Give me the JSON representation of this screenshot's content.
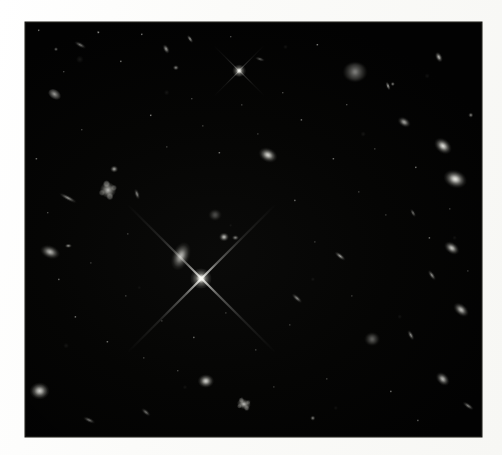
{
  "page": {
    "background_color": "#fdfdfc",
    "width": 502,
    "height": 455
  },
  "image": {
    "alt_text": "Deep field astronomical image of distant galaxies",
    "frame": {
      "x": 25,
      "y": 22,
      "width": 457,
      "height": 415
    },
    "background_color": "#010101",
    "object_color": "#fffff5",
    "caption": ""
  },
  "chart_data": {
    "type": "scatter",
    "title": "",
    "xlabel": "",
    "ylabel": "",
    "note": "Positions are percentages within the image frame; size in frame-relative percent; brightness 0-1.",
    "objects": [
      {
        "name": "faint-streak-galaxy",
        "shape": "edge-on",
        "x": 12.0,
        "y": 5.5,
        "w": 3.0,
        "h": 1.3,
        "rot": 28,
        "bright": 0.52
      },
      {
        "name": "compact-knot",
        "shape": "round",
        "x": 6.8,
        "y": 6.5,
        "w": 1.1,
        "h": 1.1,
        "rot": 0,
        "bright": 0.45
      },
      {
        "name": "elongated-galaxy-top",
        "shape": "elliptical",
        "x": 30.8,
        "y": 6.6,
        "w": 2.4,
        "h": 1.5,
        "rot": 62,
        "bright": 0.62
      },
      {
        "name": "bright-spindle-upper",
        "shape": "edge-on",
        "x": 36.0,
        "y": 4.0,
        "w": 2.2,
        "h": 1.0,
        "rot": 55,
        "bright": 0.66
      },
      {
        "name": "diffuse-galaxy-upper",
        "shape": "round",
        "x": 33.0,
        "y": 11.0,
        "w": 1.6,
        "h": 1.6,
        "rot": 0,
        "bright": 0.5
      },
      {
        "name": "foreground-star-upper",
        "shape": "star",
        "x": 46.8,
        "y": 11.8,
        "w": 3.0,
        "h": 3.0,
        "rot": 0,
        "bright": 0.95
      },
      {
        "name": "small-spindle-a",
        "shape": "edge-on",
        "x": 51.5,
        "y": 9.0,
        "w": 2.4,
        "h": 0.9,
        "rot": 18,
        "bright": 0.4
      },
      {
        "name": "fuzzy-irregular-top",
        "shape": "fuzzy",
        "x": 72.2,
        "y": 12.0,
        "w": 5.0,
        "h": 4.4,
        "rot": 0,
        "bright": 0.7
      },
      {
        "name": "bright-spindle-top-right",
        "shape": "elliptical",
        "x": 90.5,
        "y": 8.5,
        "w": 2.6,
        "h": 1.6,
        "rot": 65,
        "bright": 0.82
      },
      {
        "name": "corner-knot-right",
        "shape": "round",
        "x": 80.5,
        "y": 15.0,
        "w": 1.2,
        "h": 1.2,
        "rot": 0,
        "bright": 0.48
      },
      {
        "name": "spindle-right-upper",
        "shape": "edge-on",
        "x": 79.5,
        "y": 15.5,
        "w": 2.2,
        "h": 1.0,
        "rot": 70,
        "bright": 0.72
      },
      {
        "name": "elliptical-right-a",
        "shape": "elliptical",
        "x": 83.0,
        "y": 24.0,
        "w": 3.2,
        "h": 2.4,
        "rot": 30,
        "bright": 0.66
      },
      {
        "name": "bright-galaxy-right-a",
        "shape": "elliptical",
        "x": 91.5,
        "y": 29.8,
        "w": 4.6,
        "h": 3.6,
        "rot": 40,
        "bright": 0.88
      },
      {
        "name": "bright-galaxy-right-b",
        "shape": "round",
        "x": 94.0,
        "y": 37.8,
        "w": 5.6,
        "h": 4.6,
        "rot": 20,
        "bright": 0.92
      },
      {
        "name": "knot-right-edge",
        "shape": "round",
        "x": 97.5,
        "y": 22.5,
        "w": 1.4,
        "h": 1.4,
        "rot": 0,
        "bright": 0.52
      },
      {
        "name": "galaxy-left-upper",
        "shape": "irregular",
        "x": 6.5,
        "y": 17.5,
        "w": 3.2,
        "h": 2.6,
        "rot": 35,
        "bright": 0.64
      },
      {
        "name": "elliptical-center-upper",
        "shape": "elliptical",
        "x": 53.2,
        "y": 32.0,
        "w": 4.6,
        "h": 3.6,
        "rot": 25,
        "bright": 0.85
      },
      {
        "name": "spiral-galaxy-left",
        "shape": "spiral",
        "x": 18.2,
        "y": 40.5,
        "w": 4.8,
        "h": 6.0,
        "rot": 25,
        "bright": 0.72
      },
      {
        "name": "knot-above-spiral",
        "shape": "round",
        "x": 19.5,
        "y": 35.5,
        "w": 1.9,
        "h": 1.9,
        "rot": 0,
        "bright": 0.62
      },
      {
        "name": "edge-on-left-lower",
        "shape": "edge-on",
        "x": 9.5,
        "y": 42.5,
        "w": 4.6,
        "h": 1.2,
        "rot": 28,
        "bright": 0.58
      },
      {
        "name": "spindle-right-of-spiral",
        "shape": "edge-on",
        "x": 24.5,
        "y": 41.5,
        "w": 2.6,
        "h": 1.2,
        "rot": 72,
        "bright": 0.55
      },
      {
        "name": "fuzzy-blob-center",
        "shape": "fuzzy",
        "x": 41.5,
        "y": 46.5,
        "w": 2.6,
        "h": 2.2,
        "rot": 0,
        "bright": 0.48
      },
      {
        "name": "compact-round-center",
        "shape": "round",
        "x": 43.5,
        "y": 51.8,
        "w": 2.4,
        "h": 2.4,
        "rot": 0,
        "bright": 0.74
      },
      {
        "name": "elongated-galaxy-center",
        "shape": "elliptical",
        "x": 34.2,
        "y": 56.5,
        "w": 4.2,
        "h": 7.6,
        "rot": 22,
        "bright": 0.74
      },
      {
        "name": "bright-star-center",
        "shape": "star",
        "x": 38.6,
        "y": 61.8,
        "w": 4.6,
        "h": 4.6,
        "rot": 0,
        "bright": 1.0
      },
      {
        "name": "galaxy-left-center",
        "shape": "elliptical",
        "x": 5.5,
        "y": 55.5,
        "w": 4.8,
        "h": 3.4,
        "rot": 20,
        "bright": 0.72
      },
      {
        "name": "companion-knot-left",
        "shape": "round",
        "x": 9.5,
        "y": 54.0,
        "w": 1.6,
        "h": 1.3,
        "rot": 0,
        "bright": 0.54
      },
      {
        "name": "knot-above-star",
        "shape": "round",
        "x": 46.0,
        "y": 52.0,
        "w": 1.6,
        "h": 1.6,
        "rot": 0,
        "bright": 0.5
      },
      {
        "name": "spindle-mid-right",
        "shape": "edge-on",
        "x": 69.0,
        "y": 56.5,
        "w": 3.0,
        "h": 1.2,
        "rot": 38,
        "bright": 0.66
      },
      {
        "name": "spindle-far-right",
        "shape": "edge-on",
        "x": 85.0,
        "y": 46.0,
        "w": 2.2,
        "h": 1.0,
        "rot": 60,
        "bright": 0.5
      },
      {
        "name": "elliptical-right-mid",
        "shape": "elliptical",
        "x": 93.5,
        "y": 54.5,
        "w": 4.0,
        "h": 2.8,
        "rot": 35,
        "bright": 0.8
      },
      {
        "name": "spindle-right-mid-b",
        "shape": "edge-on",
        "x": 89.0,
        "y": 61.0,
        "w": 2.8,
        "h": 1.1,
        "rot": 55,
        "bright": 0.58
      },
      {
        "name": "spindle-center-lower",
        "shape": "edge-on",
        "x": 59.5,
        "y": 66.5,
        "w": 3.0,
        "h": 1.1,
        "rot": 42,
        "bright": 0.56
      },
      {
        "name": "elliptical-right-lower",
        "shape": "elliptical",
        "x": 95.5,
        "y": 69.5,
        "w": 4.2,
        "h": 3.0,
        "rot": 40,
        "bright": 0.76
      },
      {
        "name": "twin-knots-lower-right",
        "shape": "fuzzy",
        "x": 76.0,
        "y": 76.5,
        "w": 3.0,
        "h": 2.6,
        "rot": 0,
        "bright": 0.58
      },
      {
        "name": "spindle-lower-right",
        "shape": "edge-on",
        "x": 84.5,
        "y": 75.5,
        "w": 2.6,
        "h": 1.1,
        "rot": 62,
        "bright": 0.58
      },
      {
        "name": "bright-round-lower-left",
        "shape": "round",
        "x": 3.2,
        "y": 89.0,
        "w": 5.0,
        "h": 4.6,
        "rot": 0,
        "bright": 0.93
      },
      {
        "name": "galaxy-bottom-a",
        "shape": "round",
        "x": 39.5,
        "y": 86.5,
        "w": 4.0,
        "h": 3.6,
        "rot": 0,
        "bright": 0.82
      },
      {
        "name": "galaxy-bottom-b",
        "shape": "spiral",
        "x": 48.0,
        "y": 92.0,
        "w": 4.2,
        "h": 3.8,
        "rot": 15,
        "bright": 0.74
      },
      {
        "name": "galaxy-bottom-right",
        "shape": "elliptical",
        "x": 91.5,
        "y": 86.0,
        "w": 3.8,
        "h": 2.8,
        "rot": 45,
        "bright": 0.78
      },
      {
        "name": "spindle-bottom-right",
        "shape": "edge-on",
        "x": 97.0,
        "y": 92.5,
        "w": 3.0,
        "h": 1.3,
        "rot": 35,
        "bright": 0.62
      },
      {
        "name": "spindle-bottom-left",
        "shape": "edge-on",
        "x": 14.0,
        "y": 96.0,
        "w": 3.0,
        "h": 1.2,
        "rot": 25,
        "bright": 0.5
      },
      {
        "name": "streak-bottom-center",
        "shape": "edge-on",
        "x": 26.5,
        "y": 94.0,
        "w": 2.6,
        "h": 1.1,
        "rot": 40,
        "bright": 0.46
      },
      {
        "name": "point-source-bottom",
        "shape": "round",
        "x": 63.0,
        "y": 95.5,
        "w": 1.4,
        "h": 1.4,
        "rot": 0,
        "bright": 0.48
      }
    ],
    "point_sources": [
      {
        "x": 3.0,
        "y": 2.0,
        "b": 0.35
      },
      {
        "x": 8.5,
        "y": 12.0,
        "b": 0.3
      },
      {
        "x": 16.0,
        "y": 2.5,
        "b": 0.33
      },
      {
        "x": 21.0,
        "y": 9.5,
        "b": 0.28
      },
      {
        "x": 25.5,
        "y": 3.0,
        "b": 0.3
      },
      {
        "x": 27.5,
        "y": 22.5,
        "b": 0.32
      },
      {
        "x": 36.5,
        "y": 18.5,
        "b": 0.28
      },
      {
        "x": 39.0,
        "y": 25.0,
        "b": 0.26
      },
      {
        "x": 42.5,
        "y": 31.5,
        "b": 0.3
      },
      {
        "x": 47.5,
        "y": 20.0,
        "b": 0.27
      },
      {
        "x": 51.0,
        "y": 27.0,
        "b": 0.25
      },
      {
        "x": 56.5,
        "y": 17.0,
        "b": 0.29
      },
      {
        "x": 60.5,
        "y": 23.5,
        "b": 0.26
      },
      {
        "x": 64.0,
        "y": 5.5,
        "b": 0.31
      },
      {
        "x": 67.5,
        "y": 33.0,
        "b": 0.28
      },
      {
        "x": 70.5,
        "y": 20.0,
        "b": 0.3
      },
      {
        "x": 73.0,
        "y": 41.0,
        "b": 0.27
      },
      {
        "x": 76.5,
        "y": 30.5,
        "b": 0.26
      },
      {
        "x": 79.0,
        "y": 46.5,
        "b": 0.25
      },
      {
        "x": 85.5,
        "y": 35.0,
        "b": 0.28
      },
      {
        "x": 88.5,
        "y": 52.0,
        "b": 0.26
      },
      {
        "x": 93.0,
        "y": 45.0,
        "b": 0.27
      },
      {
        "x": 97.0,
        "y": 60.0,
        "b": 0.25
      },
      {
        "x": 2.5,
        "y": 33.0,
        "b": 0.28
      },
      {
        "x": 5.0,
        "y": 46.0,
        "b": 0.3
      },
      {
        "x": 7.5,
        "y": 62.0,
        "b": 0.26
      },
      {
        "x": 11.0,
        "y": 71.0,
        "b": 0.27
      },
      {
        "x": 14.5,
        "y": 58.0,
        "b": 0.25
      },
      {
        "x": 18.0,
        "y": 77.0,
        "b": 0.28
      },
      {
        "x": 22.0,
        "y": 66.0,
        "b": 0.26
      },
      {
        "x": 26.0,
        "y": 81.0,
        "b": 0.27
      },
      {
        "x": 30.0,
        "y": 72.0,
        "b": 0.25
      },
      {
        "x": 33.5,
        "y": 84.0,
        "b": 0.28
      },
      {
        "x": 37.0,
        "y": 76.0,
        "b": 0.26
      },
      {
        "x": 44.0,
        "y": 70.0,
        "b": 0.25
      },
      {
        "x": 50.5,
        "y": 79.0,
        "b": 0.27
      },
      {
        "x": 54.5,
        "y": 88.0,
        "b": 0.25
      },
      {
        "x": 58.0,
        "y": 73.0,
        "b": 0.26
      },
      {
        "x": 66.0,
        "y": 86.0,
        "b": 0.27
      },
      {
        "x": 71.5,
        "y": 66.0,
        "b": 0.25
      },
      {
        "x": 80.0,
        "y": 89.0,
        "b": 0.27
      },
      {
        "x": 86.0,
        "y": 96.0,
        "b": 0.25
      },
      {
        "x": 45.0,
        "y": 3.5,
        "b": 0.3
      },
      {
        "x": 59.0,
        "y": 43.0,
        "b": 0.26
      },
      {
        "x": 12.5,
        "y": 26.0,
        "b": 0.28
      },
      {
        "x": 31.0,
        "y": 30.0,
        "b": 0.26
      },
      {
        "x": 63.5,
        "y": 53.0,
        "b": 0.25
      },
      {
        "x": 22.5,
        "y": 51.0,
        "b": 0.26
      }
    ]
  }
}
